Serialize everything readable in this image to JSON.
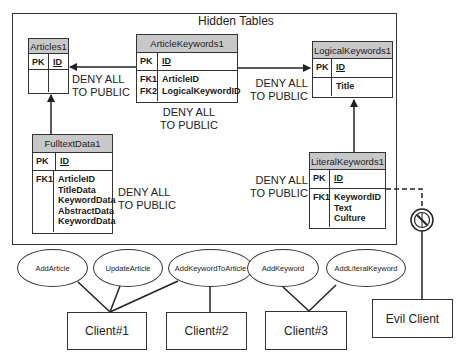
{
  "frame": {
    "title": "Hidden Tables"
  },
  "tables": {
    "articles": {
      "name": "Articles1",
      "pk": "PK",
      "pk_field": "ID"
    },
    "article_keywords": {
      "name": "ArticleKeywords1",
      "pk": "PK",
      "pk_field": "ID",
      "fk_keys": [
        "FK1",
        "FK2"
      ],
      "fk_fields": [
        "ArticleID",
        "LogicalKeywordID"
      ]
    },
    "logical_keywords": {
      "name": "LogicalKeywords1",
      "pk": "PK",
      "pk_field": "ID",
      "fields": [
        "Title"
      ]
    },
    "fulltext_data": {
      "name": "FulltextData1",
      "pk": "PK",
      "pk_field": "ID",
      "fk_keys": [
        "FK1"
      ],
      "fk_fields": [
        "ArticleID",
        "TitleData",
        "KeywordData",
        "AbstractData",
        "KeywordData"
      ]
    },
    "literal_keywords": {
      "name": "LiteralKeywords1",
      "pk": "PK",
      "pk_field": "ID",
      "fk_keys": [
        "FK1"
      ],
      "fk_fields": [
        "KeywordID",
        "Text",
        "Culture"
      ]
    }
  },
  "deny_labels": {
    "line1": "DENY ALL",
    "line2": "TO PUBLIC"
  },
  "procedures": [
    "AddArticle",
    "UpdateArticle",
    "AddKeywordToArticle",
    "AddKeyword",
    "AddLiteralKeyword"
  ],
  "clients": [
    "Client#1",
    "Client#2",
    "Client#3",
    "Evil Client"
  ],
  "icons": {
    "blocked": "no-access-icon"
  },
  "colors": {
    "header_fill": "#c8c8c8",
    "line": "#333333"
  }
}
